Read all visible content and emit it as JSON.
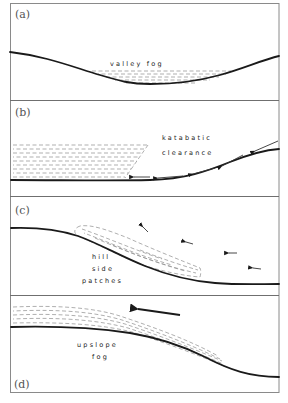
{
  "figure": {
    "type": "schematic",
    "panels": [
      {
        "id": "a",
        "label": "(a)",
        "captions": [
          "valley fog"
        ]
      },
      {
        "id": "b",
        "label": "(b)",
        "captions": [
          "katabatic",
          "clearance"
        ]
      },
      {
        "id": "c",
        "label": "(c)",
        "captions": [
          "hill",
          "side",
          "patches"
        ]
      },
      {
        "id": "d",
        "label": "(d)",
        "captions": [
          "upslope",
          "fog"
        ]
      }
    ]
  },
  "colors": {
    "ground": "#1a1a1a",
    "fog_hatching": "#8c8c8c",
    "frame": "#8a8a8a",
    "text": "#222222"
  }
}
